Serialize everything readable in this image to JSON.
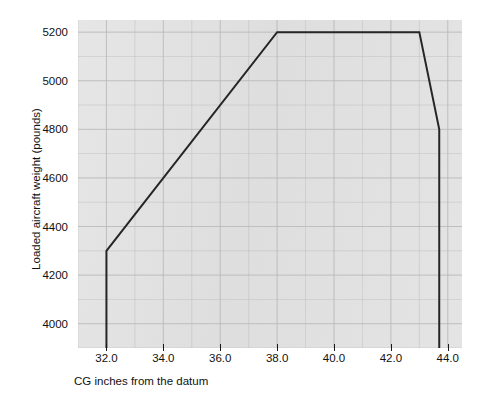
{
  "chart_data": {
    "type": "line",
    "title": "",
    "subtitle": "",
    "xlabel": "CG inches from the datum",
    "ylabel": "Loaded aircraft weight (pounds)",
    "xlim": [
      31.0,
      44.5
    ],
    "ylim": [
      3900,
      5250
    ],
    "xticks": [
      "32.0",
      "34.0",
      "36.0",
      "38.0",
      "40.0",
      "42.0",
      "44.0"
    ],
    "xtick_values": [
      32.0,
      34.0,
      36.0,
      38.0,
      40.0,
      42.0,
      44.0
    ],
    "yticks": [
      "5200",
      "5000",
      "4800",
      "4600",
      "4400",
      "4200",
      "4000"
    ],
    "ytick_values": [
      5200,
      5000,
      4800,
      4600,
      4400,
      4200,
      4000
    ],
    "grid": true,
    "grid_x_step": 1.0,
    "grid_y_step": 100,
    "legend": "none",
    "legend_position": "none",
    "annotations": [],
    "series": [
      {
        "name": "CG envelope",
        "color": "#262626",
        "line_width": 2,
        "x": [
          32.0,
          32.0,
          38.0,
          43.0,
          43.7,
          43.7
        ],
        "y": [
          3900,
          4300,
          5200,
          5200,
          4800,
          3900
        ]
      }
    ],
    "plot_background": "#e2e2e2",
    "figure_background": "#ffffff",
    "axis_color": "#1a1a1a",
    "grid_color": "#b9b9b9"
  }
}
